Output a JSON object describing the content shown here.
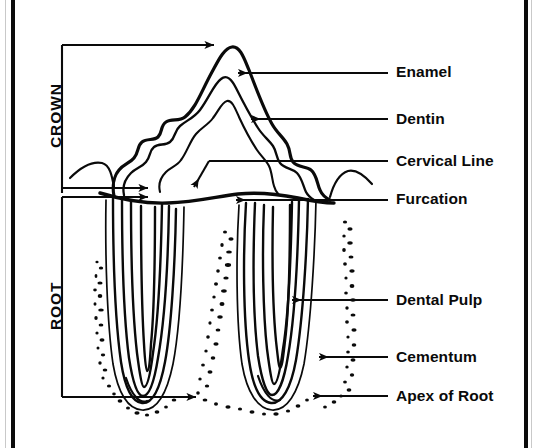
{
  "diagram": {
    "type": "labeled-anatomical-diagram",
    "ink_color": "#0a0a0a",
    "background_color": "#ffffff",
    "frame_color": "#0b0b0b"
  },
  "region_labels": [
    {
      "id": "crown",
      "text": "CROWN",
      "orientation": "vertical-ccw",
      "bracket_top": 45,
      "bracket_bottom": 193
    },
    {
      "id": "root",
      "text": "ROOT",
      "orientation": "vertical-ccw",
      "bracket_top": 193,
      "bracket_bottom": 397
    }
  ],
  "callouts": [
    {
      "id": "enamel",
      "text": "Enamel",
      "label_x": 396,
      "label_y": 72,
      "leader_y": 73,
      "arrow_tip_x": 234,
      "arrow": true,
      "arrow_style": "horizontal-left"
    },
    {
      "id": "dentin",
      "text": "Dentin",
      "label_x": 396,
      "label_y": 119,
      "leader_y": 119,
      "arrow_tip_x": 247,
      "arrow": true,
      "arrow_style": "horizontal-left"
    },
    {
      "id": "cervical-line",
      "text": "Cervical Line",
      "label_x": 396,
      "label_y": 161,
      "leader_y": 161,
      "arrow_tip_x": 209,
      "arrow": true,
      "arrow_style": "diagonal-down-left"
    },
    {
      "id": "furcation",
      "text": "Furcation",
      "label_x": 396,
      "label_y": 199,
      "leader_y": 200,
      "arrow_tip_x": 232,
      "arrow": true,
      "arrow_style": "horizontal-left"
    },
    {
      "id": "dental-pulp",
      "text": "Dental Pulp",
      "label_x": 396,
      "label_y": 300,
      "leader_y": 300,
      "arrow_tip_x": 288,
      "arrow": true,
      "arrow_style": "horizontal-left"
    },
    {
      "id": "cementum",
      "text": "Cementum",
      "label_x": 396,
      "label_y": 357,
      "leader_y": 357,
      "arrow_tip_x": 315,
      "arrow": true,
      "arrow_style": "horizontal-left"
    },
    {
      "id": "apex-of-root",
      "text": "Apex of Root",
      "label_x": 396,
      "label_y": 396,
      "leader_y": 396,
      "arrow_tip_x": 309,
      "arrow": true,
      "arrow_style": "horizontal-left"
    }
  ],
  "anatomy_parts": [
    {
      "id": "enamel-outline",
      "name": "Enamel outer contour"
    },
    {
      "id": "dentin-outline",
      "name": "Dentin contour"
    },
    {
      "id": "pulp-chamber",
      "name": "Pulp chamber and root canals"
    },
    {
      "id": "cervical-line",
      "name": "Cervical line (cemento-enamel junction)"
    },
    {
      "id": "furcation",
      "name": "Furcation between roots"
    },
    {
      "id": "cementum-layer",
      "name": "Cementum layer on root surface"
    },
    {
      "id": "alveolar-bone",
      "name": "Stippled alveolar bone / periodontal ligament"
    },
    {
      "id": "root-mesial",
      "name": "Mesial root"
    },
    {
      "id": "root-distal",
      "name": "Distal root"
    }
  ]
}
